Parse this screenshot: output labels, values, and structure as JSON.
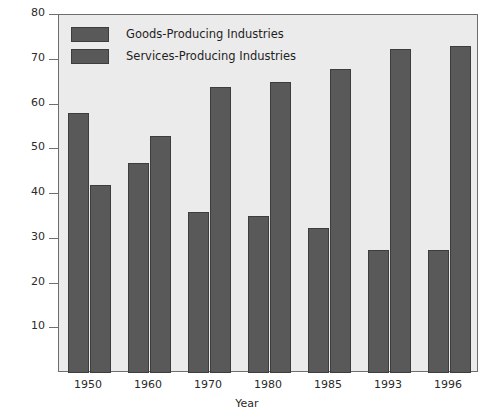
{
  "chart_data": {
    "type": "bar",
    "title": "",
    "xlabel": "Year",
    "ylabel": "Percent",
    "categories": [
      "1950",
      "1960",
      "1970",
      "1980",
      "1985",
      "1993",
      "1996"
    ],
    "series": [
      {
        "name": "Goods-Producing Industries",
        "values": [
          58,
          47,
          36,
          35,
          32.5,
          27.5,
          27.5
        ],
        "color": "#595959"
      },
      {
        "name": "Services-Producing Industries",
        "values": [
          42,
          53,
          64,
          65,
          68,
          72.5,
          73
        ],
        "color": "#595959"
      }
    ],
    "ylim": [
      0,
      80
    ],
    "yticks": [
      10,
      20,
      30,
      40,
      50,
      60,
      70,
      80
    ],
    "grid": false,
    "legend_position": "top-left",
    "plot_background": "#ebebeb",
    "axis_color": "#6e6e6e"
  }
}
